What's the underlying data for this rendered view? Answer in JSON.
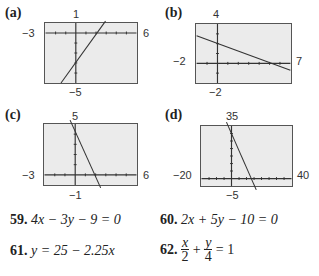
{
  "graphs": [
    {
      "label": "(a)",
      "window": {
        "xmin": -3,
        "xmax": 6,
        "ymin": -5,
        "ymax": 1
      },
      "tick_labels": {
        "top": "1",
        "left": "−3",
        "right": "6",
        "bottom": "−5"
      },
      "line": {
        "slope": 1.3333,
        "intercept": -3
      }
    },
    {
      "label": "(b)",
      "window": {
        "xmin": -2,
        "xmax": 7,
        "ymin": -2,
        "ymax": 4
      },
      "tick_labels": {
        "top": "4",
        "left": "−2",
        "right": "7",
        "bottom": "−2"
      },
      "line": {
        "slope": -0.4,
        "intercept": 2
      }
    },
    {
      "label": "(c)",
      "window": {
        "xmin": -3,
        "xmax": 6,
        "ymin": -1,
        "ymax": 5
      },
      "tick_labels": {
        "top": "5",
        "left": "−3",
        "right": "6",
        "bottom": "−1"
      },
      "line": {
        "slope": -2,
        "intercept": 4
      }
    },
    {
      "label": "(d)",
      "window": {
        "xmin": -20,
        "xmax": 40,
        "ymin": -5,
        "ymax": 35
      },
      "tick_labels": {
        "top": "35",
        "left": "−20",
        "right": "40",
        "bottom": "−5"
      },
      "line": {
        "slope": -2.25,
        "intercept": 25
      }
    }
  ],
  "exercises": [
    {
      "number": "59.",
      "equation": "4x − 3y − 9 = 0"
    },
    {
      "number": "60.",
      "equation": "2x + 5y − 10 = 0"
    },
    {
      "number": "61.",
      "equation": "y = 25 − 2.25x"
    },
    {
      "number": "62.",
      "frac1_num": "x",
      "frac1_den": "2",
      "plus": "+",
      "frac2_num": "y",
      "frac2_den": "4",
      "rhs": "= 1"
    }
  ]
}
